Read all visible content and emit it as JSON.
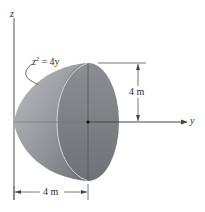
{
  "figure": {
    "axes": {
      "z_label": "z",
      "y_label": "y"
    },
    "equation": {
      "lhs_var": "z",
      "exponent": "2",
      "rhs": " = 4y"
    },
    "dimensions": {
      "height_label": "4 m",
      "length_label": "4 m"
    },
    "colors": {
      "solid_fill": "#8e9296",
      "face_fill": "#7f8387",
      "highlight": "#c9cccf",
      "line": "#333333"
    }
  }
}
